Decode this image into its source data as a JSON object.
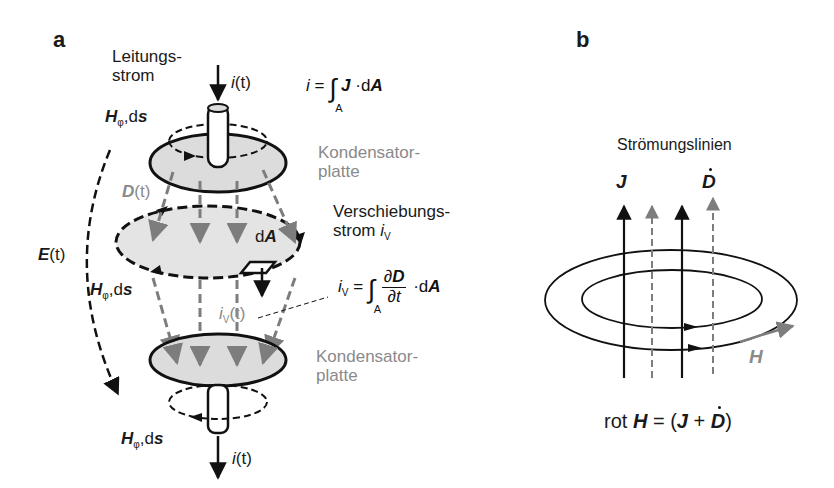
{
  "panel_a": {
    "label": "a",
    "conduction_current": {
      "line1": "Leitungs-",
      "line2": "strom"
    },
    "input_current": {
      "symbol": "i",
      "arg": "(t)"
    },
    "output_current": {
      "symbol": "i",
      "arg": "(t)"
    },
    "formula_conduction": {
      "lhs": "i",
      "eq": "=",
      "integral": "∫",
      "domain": "A",
      "integrand": "J",
      "dot": "·",
      "d": "d",
      "A": "A"
    },
    "field_h_top": {
      "H": "H",
      "sub": "φ",
      "rest": ",d",
      "s": "s"
    },
    "field_h_middle": {
      "H": "H",
      "sub": "φ",
      "rest": ",d",
      "s": "s"
    },
    "field_h_bottom": {
      "H": "H",
      "sub": "φ",
      "rest": ",d",
      "s": "s"
    },
    "displacement_field": {
      "D": "D",
      "arg": "(t)"
    },
    "electric_field": {
      "E": "E",
      "arg": "(t)"
    },
    "capacitor_plate_top": {
      "line1": "Kondensator-",
      "line2": "platte"
    },
    "capacitor_plate_bottom": {
      "line1": "Kondensator-",
      "line2": "platte"
    },
    "displacement_current": {
      "line1": "Verschiebungs-",
      "line2": "strom ",
      "symbol": "i",
      "sub": "V"
    },
    "area_element": {
      "d": "d",
      "A": "A"
    },
    "iv_label": {
      "symbol": "i",
      "sub": "V",
      "arg": "(t)"
    },
    "formula_displacement": {
      "lhs": "i",
      "lhs_sub": "V",
      "eq": "=",
      "integral": "∫",
      "domain": "A",
      "num": "∂D",
      "num_d": "∂",
      "num_D": "D",
      "den": "∂t",
      "dot": "·",
      "d": "d",
      "A": "A"
    }
  },
  "panel_b": {
    "label": "b",
    "title": "Strömungslinien",
    "J_label": "J",
    "Ddot_label": "D",
    "H_label": "H",
    "formula": {
      "rot": "rot ",
      "H": "H",
      "eq": " = (",
      "J": "J",
      "plus": " + ",
      "D": "D",
      "close": ")"
    }
  },
  "colors": {
    "black": "#111111",
    "gray_text": "#8a8a8a",
    "gray_arrow": "#7d7d7d",
    "plate_fill": "#dcdcdc",
    "background": "#ffffff"
  }
}
